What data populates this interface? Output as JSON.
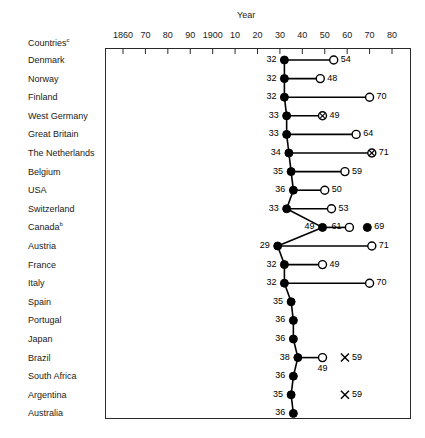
{
  "chart_data": {
    "type": "line",
    "title": "",
    "xlabel": "Year",
    "ylabel": "Countries",
    "ylabel_sup": "c",
    "xlim": [
      1855,
      1985
    ],
    "grid": false,
    "legend": "none",
    "xticks": [
      1860,
      1870,
      1880,
      1890,
      1900,
      1910,
      1920,
      1930,
      1940,
      1950,
      1960,
      1970,
      1980
    ],
    "xticklabels": [
      "1860",
      "70",
      "80",
      "90",
      "1900",
      "10",
      "20",
      "30",
      "40",
      "50",
      "60",
      "70",
      "80"
    ],
    "categories": [
      "Denmark",
      "Norway",
      "Finland",
      "West Germany",
      "Great Britain",
      "The Netherlands",
      "Belgium",
      "USA",
      "Switzerland",
      "Canada",
      "Austria",
      "France",
      "Italy",
      "Spain",
      "Portugal",
      "Japan",
      "Brazil",
      "South Africa",
      "Argentina",
      "Australia"
    ],
    "category_sups": {
      "Canada": "b"
    },
    "rows": [
      {
        "country": "Denmark",
        "points": [
          {
            "year": 1932,
            "label": "32",
            "marker": "filled",
            "label_side": "left",
            "connected": true
          },
          {
            "year": 1954,
            "label": "54",
            "marker": "open",
            "label_side": "right",
            "connected": true
          }
        ]
      },
      {
        "country": "Norway",
        "points": [
          {
            "year": 1932,
            "label": "32",
            "marker": "filled",
            "label_side": "left",
            "connected": true
          },
          {
            "year": 1948,
            "label": "48",
            "marker": "open",
            "label_side": "right",
            "connected": true
          }
        ]
      },
      {
        "country": "Finland",
        "points": [
          {
            "year": 1932,
            "label": "32",
            "marker": "filled",
            "label_side": "left",
            "connected": true
          },
          {
            "year": 1970,
            "label": "70",
            "marker": "open",
            "label_side": "right",
            "connected": true
          }
        ]
      },
      {
        "country": "West Germany",
        "points": [
          {
            "year": 1933,
            "label": "33",
            "marker": "filled",
            "label_side": "left",
            "connected": true
          },
          {
            "year": 1949,
            "label": "49",
            "marker": "crossed",
            "label_side": "right",
            "connected": true
          }
        ]
      },
      {
        "country": "Great Britain",
        "points": [
          {
            "year": 1933,
            "label": "33",
            "marker": "filled",
            "label_side": "left",
            "connected": true
          },
          {
            "year": 1964,
            "label": "64",
            "marker": "open",
            "label_side": "right",
            "connected": true
          }
        ]
      },
      {
        "country": "The Netherlands",
        "points": [
          {
            "year": 1934,
            "label": "34",
            "marker": "filled",
            "label_side": "left",
            "connected": true
          },
          {
            "year": 1971,
            "label": "71",
            "marker": "crossed",
            "label_side": "right",
            "connected": true
          }
        ]
      },
      {
        "country": "Belgium",
        "points": [
          {
            "year": 1935,
            "label": "35",
            "marker": "filled",
            "label_side": "left",
            "connected": true
          },
          {
            "year": 1959,
            "label": "59",
            "marker": "open",
            "label_side": "right",
            "connected": true
          }
        ]
      },
      {
        "country": "USA",
        "points": [
          {
            "year": 1936,
            "label": "36",
            "marker": "filled",
            "label_side": "left",
            "connected": true
          },
          {
            "year": 1950,
            "label": "50",
            "marker": "open",
            "label_side": "right",
            "connected": true
          }
        ]
      },
      {
        "country": "Switzerland",
        "points": [
          {
            "year": 1933,
            "label": "33",
            "marker": "filled",
            "label_side": "left",
            "connected": true
          },
          {
            "year": 1953,
            "label": "53",
            "marker": "open",
            "label_side": "right",
            "connected": true
          }
        ]
      },
      {
        "country": "Canada",
        "points": [
          {
            "year": 1949,
            "label": "49",
            "marker": "filled",
            "label_side": "left",
            "connected": true
          },
          {
            "year": 1961,
            "label": "61",
            "marker": "open",
            "label_side": "left",
            "connected": true
          },
          {
            "year": 1969,
            "label": "69",
            "marker": "filled",
            "label_side": "right",
            "connected": false
          }
        ]
      },
      {
        "country": "Austria",
        "points": [
          {
            "year": 1929,
            "label": "29",
            "marker": "filled",
            "label_side": "left",
            "connected": true
          },
          {
            "year": 1971,
            "label": "71",
            "marker": "open",
            "label_side": "right",
            "connected": true
          }
        ]
      },
      {
        "country": "France",
        "points": [
          {
            "year": 1932,
            "label": "32",
            "marker": "filled",
            "label_side": "left",
            "connected": true
          },
          {
            "year": 1949,
            "label": "49",
            "marker": "open",
            "label_side": "right",
            "connected": true
          }
        ]
      },
      {
        "country": "Italy",
        "points": [
          {
            "year": 1932,
            "label": "32",
            "marker": "filled",
            "label_side": "left",
            "connected": true
          },
          {
            "year": 1970,
            "label": "70",
            "marker": "open",
            "label_side": "right",
            "connected": true
          }
        ]
      },
      {
        "country": "Spain",
        "points": [
          {
            "year": 1935,
            "label": "35",
            "marker": "filled",
            "label_side": "left",
            "connected": true
          }
        ]
      },
      {
        "country": "Portugal",
        "points": [
          {
            "year": 1936,
            "label": "36",
            "marker": "filled",
            "label_side": "left",
            "connected": true
          }
        ]
      },
      {
        "country": "Japan",
        "points": [
          {
            "year": 1936,
            "label": "36",
            "marker": "filled",
            "label_side": "left",
            "connected": true
          }
        ]
      },
      {
        "country": "Brazil",
        "points": [
          {
            "year": 1938,
            "label": "38",
            "marker": "filled",
            "label_side": "left",
            "connected": true
          },
          {
            "year": 1949,
            "label": "49",
            "marker": "open",
            "label_side": "below",
            "connected": true
          },
          {
            "year": 1959,
            "label": "59",
            "marker": "x",
            "label_side": "right",
            "connected": false
          }
        ]
      },
      {
        "country": "South Africa",
        "points": [
          {
            "year": 1936,
            "label": "36",
            "marker": "filled",
            "label_side": "left",
            "connected": true
          }
        ]
      },
      {
        "country": "Argentina",
        "points": [
          {
            "year": 1935,
            "label": "35",
            "marker": "filled",
            "label_side": "left",
            "connected": true
          },
          {
            "year": 1959,
            "label": "59",
            "marker": "x",
            "label_side": "right",
            "connected": false
          }
        ]
      },
      {
        "country": "Australia",
        "points": [
          {
            "year": 1936,
            "label": "36",
            "marker": "filled",
            "label_side": "left",
            "connected": true
          }
        ]
      }
    ],
    "connector_chain": {
      "description": "left filled markers connected vertically down the column",
      "enabled": true
    }
  },
  "colors": {
    "ink": "#000000",
    "frame": "#2a2a2a",
    "background": "#ffffff"
  }
}
